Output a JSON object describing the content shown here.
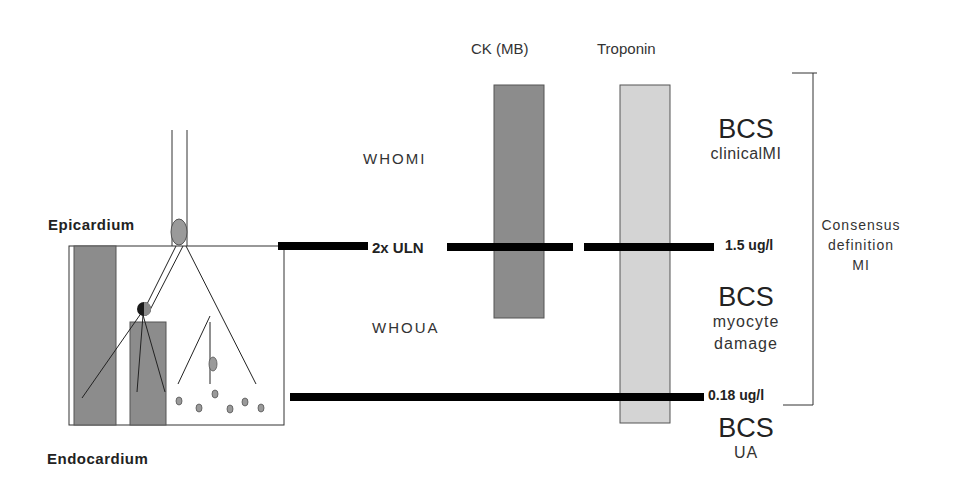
{
  "diagram": {
    "type": "biomarker-threshold-schematic",
    "tissue": {
      "top_label": "Epicardium",
      "bottom_label": "Endocardium"
    },
    "markers": {
      "headers": [
        "CK  (MB)",
        "Troponin"
      ],
      "ck_bar_color": "#8c8c8c",
      "troponin_bar_color": "#d4d4d4"
    },
    "who": {
      "mi_label": "WHOMI",
      "ua_label": "WHOUA",
      "threshold_label": "2x ULN"
    },
    "thresholds": {
      "upper": "1.5 ug/l",
      "lower": "0.18 ug/l"
    },
    "bcs": [
      {
        "title": "BCS",
        "subtitle": [
          "clinicalMI"
        ]
      },
      {
        "title": "BCS",
        "subtitle": [
          "myocyte",
          "damage"
        ]
      },
      {
        "title": "BCS",
        "subtitle": [
          "UA"
        ]
      }
    ],
    "consensus": {
      "lines": [
        "Consensus",
        "definition",
        "MI"
      ]
    },
    "colors": {
      "line": "#000000",
      "tissue_fill": "#8c8c8c",
      "outline": "#333333"
    }
  }
}
